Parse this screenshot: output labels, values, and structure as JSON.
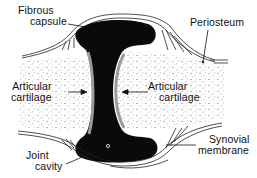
{
  "diagram": {
    "colors": {
      "background": "#ffffff",
      "joint_cavity": "#0a0a0a",
      "cartilage": "#9a9a9a",
      "bone_stipple": "#8a8a8a",
      "ink": "#111111"
    },
    "labels": {
      "fibrous_capsule": {
        "line1": "Fibrous",
        "line2": "capsule"
      },
      "periosteum": {
        "line1": "Periosteum"
      },
      "articular_cartilage_left": {
        "line1": "Articular",
        "line2": "cartilage"
      },
      "articular_cartilage_right": {
        "line1": "Articular",
        "line2": "cartilage"
      },
      "joint_cavity": {
        "line1": "Joint",
        "line2": "cavity"
      },
      "synovial_membrane": {
        "line1": "Synovial",
        "line2": "membrane"
      }
    }
  }
}
